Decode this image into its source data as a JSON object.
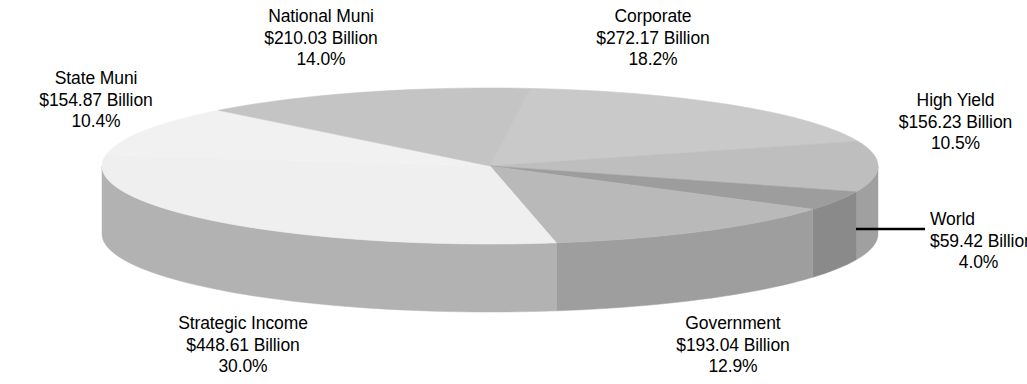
{
  "chart_data": {
    "type": "pie",
    "title": "",
    "subtitle": "",
    "xlabel": "",
    "ylabel": "",
    "three_d": true,
    "legend_position": "none",
    "grid": false,
    "value_unit": "Billion",
    "value_prefix": "$",
    "total_value": 1494.37,
    "total_percent": 100.0,
    "categories": [
      "Corporate",
      "High Yield",
      "World",
      "Government",
      "Strategic Income",
      "State Muni",
      "National Muni"
    ],
    "values": [
      272.17,
      156.23,
      59.42,
      193.04,
      448.61,
      154.87,
      210.03
    ],
    "percents": [
      18.2,
      10.5,
      4.0,
      12.9,
      30.0,
      10.4,
      14.0
    ],
    "slices": [
      {
        "name": "Corporate",
        "value": 272.17,
        "percent": 18.2,
        "value_label": "$272.17 Billion",
        "percent_label": "18.2%",
        "top_color": "#c9c9c9",
        "side_color": "#a9a9a9"
      },
      {
        "name": "High Yield",
        "value": 156.23,
        "percent": 10.5,
        "value_label": "$156.23 Billion",
        "percent_label": "10.5%",
        "top_color": "#bebebe",
        "side_color": "#a0a0a0"
      },
      {
        "name": "World",
        "value": 59.42,
        "percent": 4.0,
        "value_label": "$59.42 Billion",
        "percent_label": "4.0%",
        "top_color": "#9d9d9d",
        "side_color": "#8a8a8a"
      },
      {
        "name": "Government",
        "value": 193.04,
        "percent": 12.9,
        "value_label": "$193.04 Billion",
        "percent_label": "12.9%",
        "top_color": "#b9b9b9",
        "side_color": "#9e9e9e"
      },
      {
        "name": "Strategic Income",
        "value": 448.61,
        "percent": 30.0,
        "value_label": "$448.61 Billion",
        "percent_label": "30.0%",
        "top_color": "#efefef",
        "side_color": "#b2b2b2"
      },
      {
        "name": "State Muni",
        "value": 154.87,
        "percent": 10.4,
        "value_label": "$154.87 Billion",
        "percent_label": "10.4%",
        "top_color": "#f1f1f1",
        "side_color": "#b2b2b2"
      },
      {
        "name": "National Muni",
        "value": 210.03,
        "percent": 14.0,
        "value_label": "$210.03 Billion",
        "percent_label": "14.0%",
        "top_color": "#c4c4c4",
        "side_color": "#a6a6a6"
      }
    ]
  },
  "labels": {
    "national_muni": {
      "name": "National Muni",
      "value": "$210.03 Billion",
      "percent": "14.0%"
    },
    "corporate": {
      "name": "Corporate",
      "value": "$272.17 Billion",
      "percent": "18.2%"
    },
    "state_muni": {
      "name": "State Muni",
      "value": "$154.87 Billion",
      "percent": "10.4%"
    },
    "high_yield": {
      "name": "High Yield",
      "value": "$156.23 Billion",
      "percent": "10.5%"
    },
    "world": {
      "name": "World",
      "value": "$59.42 Billion",
      "percent": "4.0%"
    },
    "strategic_income": {
      "name": "Strategic Income",
      "value": "$448.61 Billion",
      "percent": "30.0%"
    },
    "government": {
      "name": "Government",
      "value": "$193.04 Billion",
      "percent": "12.9%"
    }
  },
  "background_color": "#ffffff",
  "text_color": "#000000",
  "leader_line_color": "#000000"
}
